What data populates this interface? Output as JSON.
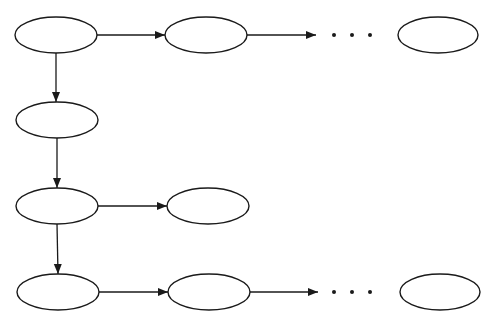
{
  "diagram": {
    "stroke": "#1a1a1a",
    "background": "#ffffff",
    "nodes": [
      {
        "id": "r1c1",
        "cx": 56,
        "cy": 35,
        "rx": 41,
        "ry": 18
      },
      {
        "id": "r1c2",
        "cx": 206,
        "cy": 35,
        "rx": 41,
        "ry": 18
      },
      {
        "id": "r1c3",
        "cx": 438,
        "cy": 35,
        "rx": 40,
        "ry": 18
      },
      {
        "id": "r2c1",
        "cx": 57,
        "cy": 120,
        "rx": 41,
        "ry": 18
      },
      {
        "id": "r3c1",
        "cx": 57,
        "cy": 206,
        "rx": 41,
        "ry": 18
      },
      {
        "id": "r3c2",
        "cx": 208,
        "cy": 206,
        "rx": 41,
        "ry": 18
      },
      {
        "id": "r4c1",
        "cx": 58,
        "cy": 292,
        "rx": 41,
        "ry": 18
      },
      {
        "id": "r4c2",
        "cx": 209,
        "cy": 292,
        "rx": 41,
        "ry": 18
      },
      {
        "id": "r4c3",
        "cx": 440,
        "cy": 292,
        "rx": 40,
        "ry": 18
      }
    ],
    "edges": [
      {
        "from": "r1c1",
        "to": "r1c2",
        "x1": 97,
        "y1": 35,
        "x2": 165,
        "y2": 35
      },
      {
        "from": "r1c2",
        "to": "ellipsis1",
        "x1": 247,
        "y1": 35,
        "x2": 316,
        "y2": 35
      },
      {
        "from": "r1c1",
        "to": "r2c1",
        "x1": 56,
        "y1": 53,
        "x2": 56,
        "y2": 102
      },
      {
        "from": "r2c1",
        "to": "r3c1",
        "x1": 57,
        "y1": 138,
        "x2": 57,
        "y2": 188
      },
      {
        "from": "r3c1",
        "to": "r3c2",
        "x1": 98,
        "y1": 206,
        "x2": 167,
        "y2": 206
      },
      {
        "from": "r3c1",
        "to": "r4c1",
        "x1": 57,
        "y1": 224,
        "x2": 58,
        "y2": 274
      },
      {
        "from": "r4c1",
        "to": "r4c2",
        "x1": 99,
        "y1": 292,
        "x2": 168,
        "y2": 292
      },
      {
        "from": "r4c2",
        "to": "ellipsis2",
        "x1": 250,
        "y1": 292,
        "x2": 318,
        "y2": 292
      }
    ],
    "ellipses": [
      {
        "id": "ellipsis1",
        "text": "• • •",
        "x": 352,
        "y": 35
      },
      {
        "id": "ellipsis2",
        "text": "• • •",
        "x": 352,
        "y": 292
      }
    ]
  }
}
